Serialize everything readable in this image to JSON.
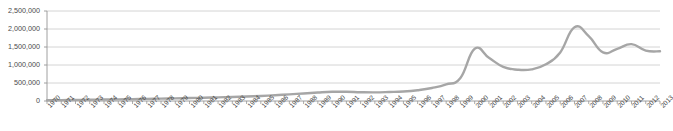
{
  "figure": {
    "title_remnant": "",
    "background": "#ffffff"
  },
  "chart_data": {
    "type": "line",
    "title": "",
    "subtitle": "",
    "xlabel": "",
    "ylabel": "",
    "ylim": [
      0,
      2500000
    ],
    "ytick_labels": [
      "2,500,000",
      "2,000,000",
      "1,500,000",
      "1,000,000",
      "500,000",
      "0"
    ],
    "yticks": [
      2500000,
      2000000,
      1500000,
      1000000,
      500000,
      0
    ],
    "grid": true,
    "grid_color": "#c9c9c9",
    "legend": false,
    "legend_position": "none",
    "line_color": "#a6a6a6",
    "line_width": 2.4,
    "markers": false,
    "categories": [
      "1970",
      "1971",
      "1972",
      "1973",
      "1974",
      "1975",
      "1976",
      "1977",
      "1978",
      "1979",
      "1980",
      "1981",
      "1982",
      "1983",
      "1984",
      "1985",
      "1986",
      "1987",
      "1988",
      "1989",
      "1990",
      "1991",
      "1992",
      "1993",
      "1994",
      "1995",
      "1996",
      "1997",
      "1998",
      "1999",
      "2000",
      "2001",
      "2002",
      "2003",
      "2004",
      "2005",
      "2006",
      "2007",
      "2008",
      "2009",
      "2010",
      "2011",
      "2012",
      "2013"
    ],
    "values": [
      20000,
      25000,
      30000,
      35000,
      40000,
      45000,
      50000,
      58000,
      66000,
      74000,
      82000,
      92000,
      102000,
      112000,
      125000,
      140000,
      160000,
      185000,
      210000,
      235000,
      255000,
      258000,
      245000,
      240000,
      250000,
      265000,
      300000,
      360000,
      460000,
      640000,
      1450000,
      1200000,
      950000,
      870000,
      880000,
      1020000,
      1350000,
      2050000,
      1800000,
      1350000,
      1450000,
      1580000,
      1400000,
      1380000
    ]
  }
}
